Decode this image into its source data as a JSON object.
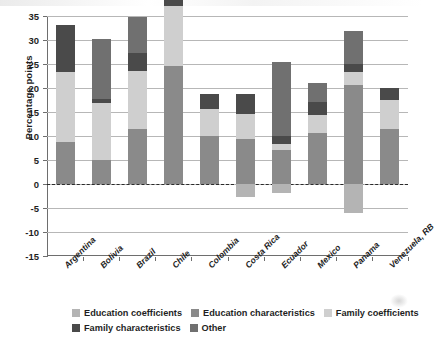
{
  "chart_data": {
    "type": "bar",
    "stacked": true,
    "title": "",
    "xlabel": "",
    "ylabel": "Percentage points",
    "ylim": [
      -15,
      35
    ],
    "ytick_labels": [
      "35",
      "30",
      "25",
      "20",
      "15",
      "10",
      "5",
      "0",
      "-5",
      "-10",
      "-15"
    ],
    "ytick_values": [
      35,
      30,
      25,
      20,
      15,
      10,
      5,
      0,
      -5,
      -10,
      -15
    ],
    "grid": true,
    "zero_reference_line": true,
    "legend_position": "bottom",
    "categories": [
      "Argentina",
      "Bolivia",
      "Brazil",
      "Chile",
      "Colombia",
      "Costa Rica",
      "Ecuador",
      "Mexico",
      "Panama",
      "Venezuela, RB"
    ],
    "series": [
      {
        "name": "Education coefficients",
        "color": "#b4b4b4",
        "values": [
          0,
          0,
          0,
          0,
          0,
          -2.7,
          -1.8,
          0,
          -6.0,
          0
        ]
      },
      {
        "name": "Education characteristics",
        "color": "#8a8a8a",
        "values": [
          8.8,
          5.0,
          11.4,
          24.6,
          10.1,
          9.3,
          7.0,
          10.6,
          20.7,
          11.4
        ]
      },
      {
        "name": "Family coefficients",
        "color": "#cfcfcf",
        "values": [
          14.5,
          11.9,
          12.1,
          12.4,
          5.5,
          5.2,
          1.3,
          3.7,
          2.7,
          6.2
        ]
      },
      {
        "name": "Family characteristics",
        "color": "#4a4a4a",
        "values": [
          9.9,
          0.8,
          3.7,
          2.8,
          3.2,
          4.2,
          1.8,
          2.7,
          1.5,
          2.4
        ]
      },
      {
        "name": "Other",
        "color": "#707070",
        "values": [
          0,
          12.6,
          7.6,
          7.2,
          0,
          0,
          15.4,
          4.1,
          7.0,
          0
        ]
      }
    ],
    "bar_totals_top": [
      30.9,
      30.1,
      31.3,
      34.6,
      18.8,
      18.7,
      23.7,
      21.1,
      25.9,
      15.8
    ],
    "bar_bottoms": [
      -2.3,
      -0.2,
      -3.5,
      -12.4,
      0,
      -2.7,
      -1.8,
      0,
      -6.0,
      -4.2
    ]
  },
  "legend": {
    "rows": [
      [
        {
          "label": "Education coefficients",
          "color": "#b4b4b4"
        },
        {
          "label": "Education characteristics",
          "color": "#8a8a8a"
        },
        {
          "label": "Family coefficients",
          "color": "#cfcfcf"
        }
      ],
      [
        {
          "label": "Family characteristics",
          "color": "#4a4a4a"
        },
        {
          "label": "Other",
          "color": "#707070"
        }
      ]
    ]
  }
}
